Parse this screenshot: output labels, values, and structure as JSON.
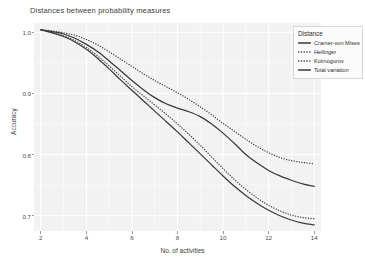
{
  "chart_data": {
    "type": "line",
    "title": "Distances between probability measures",
    "xlabel": "No. of activities",
    "ylabel": "Accuracy",
    "xlim": [
      1.7,
      14.3
    ],
    "ylim": [
      0.675,
      1.015
    ],
    "xticks": [
      2,
      4,
      6,
      8,
      10,
      12,
      14
    ],
    "yticks": [
      0.7,
      0.8,
      0.9,
      1.0
    ],
    "ytick_labels": [
      "0.7",
      "0.8",
      "0.9",
      "1.0"
    ],
    "xtick_labels": [
      "2",
      "4",
      "6",
      "8",
      "10",
      "12",
      "14"
    ],
    "grid": true,
    "legend_position": "top-right",
    "legend_title": "Distance",
    "x": [
      2,
      2.5,
      3,
      3.5,
      4,
      4.5,
      5,
      5.5,
      6,
      6.5,
      7,
      7.5,
      8,
      8.5,
      9,
      9.5,
      10,
      10.5,
      11,
      11.5,
      12,
      12.5,
      13,
      13.5,
      14
    ],
    "series": [
      {
        "name": "Cramer-von Mises",
        "linetype": "solid",
        "color": "#3a3a3a",
        "values": [
          1.004,
          1.001,
          0.997,
          0.99,
          0.98,
          0.968,
          0.953,
          0.937,
          0.921,
          0.906,
          0.893,
          0.883,
          0.876,
          0.87,
          0.862,
          0.85,
          0.835,
          0.818,
          0.8,
          0.786,
          0.774,
          0.765,
          0.758,
          0.752,
          0.748
        ]
      },
      {
        "name": "Hellinger",
        "linetype": "dotted",
        "color": "#3a3a3a",
        "values": [
          1.004,
          1.002,
          0.999,
          0.995,
          0.988,
          0.979,
          0.968,
          0.956,
          0.944,
          0.932,
          0.921,
          0.911,
          0.901,
          0.89,
          0.878,
          0.865,
          0.851,
          0.838,
          0.825,
          0.813,
          0.803,
          0.795,
          0.79,
          0.787,
          0.785
        ]
      },
      {
        "name": "Kolmogorov",
        "linetype": "dotted",
        "color": "#3a3a3a",
        "values": [
          1.004,
          1.0,
          0.994,
          0.986,
          0.975,
          0.961,
          0.945,
          0.928,
          0.911,
          0.896,
          0.881,
          0.866,
          0.85,
          0.833,
          0.815,
          0.796,
          0.777,
          0.759,
          0.743,
          0.729,
          0.717,
          0.708,
          0.701,
          0.697,
          0.695
        ]
      },
      {
        "name": "Total variation",
        "linetype": "solid",
        "color": "#3a3a3a",
        "values": [
          1.004,
          0.999,
          0.993,
          0.984,
          0.972,
          0.957,
          0.94,
          0.922,
          0.905,
          0.888,
          0.871,
          0.854,
          0.837,
          0.819,
          0.801,
          0.783,
          0.765,
          0.748,
          0.733,
          0.72,
          0.709,
          0.7,
          0.693,
          0.688,
          0.685
        ]
      }
    ]
  },
  "legend": {
    "title": "Distance",
    "items": [
      {
        "label": "Cramer-von Mises",
        "linetype": "solid"
      },
      {
        "label": "Hellinger",
        "linetype": "dotted"
      },
      {
        "label": "Kolmogorov",
        "linetype": "dotted"
      },
      {
        "label": "Total variation",
        "linetype": "solid"
      }
    ]
  },
  "colors": {
    "panel_background": "#f2f2f2",
    "grid": "#ffffff",
    "line": "#3a3a3a",
    "text": "#3d3d3d"
  }
}
